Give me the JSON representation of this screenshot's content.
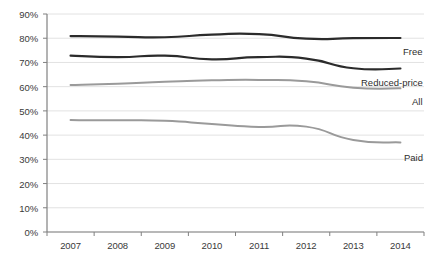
{
  "chart_data": {
    "type": "line",
    "title": "",
    "subtitle": "",
    "xlabel": "",
    "ylabel": "",
    "categories": [
      "2007",
      "2008",
      "2009",
      "2010",
      "2011",
      "2012",
      "2013",
      "2014"
    ],
    "ylim": [
      0,
      90
    ],
    "ytick_labels": [
      "0%",
      "10%",
      "20%",
      "30%",
      "40%",
      "50%",
      "60%",
      "70%",
      "80%",
      "90%"
    ],
    "ytick_values": [
      0,
      10,
      20,
      30,
      40,
      50,
      60,
      70,
      80,
      90
    ],
    "grid": "horizontal",
    "legend_position": "inline-right-of-line-ends",
    "series": [
      {
        "name": "Free",
        "label": "Free",
        "color": "#2b2b2b",
        "width": 2.2,
        "values": [
          80.9,
          80.7,
          80.4,
          81.5,
          81.7,
          79.8,
          80.0,
          80.1
        ]
      },
      {
        "name": "Reduced-price",
        "label": "Reduced-price",
        "color": "#2b2b2b",
        "width": 2.2,
        "values": [
          72.8,
          72.2,
          72.8,
          71.3,
          72.2,
          71.6,
          67.6,
          67.5
        ]
      },
      {
        "name": "All",
        "label": "All",
        "color": "#9a9a9a",
        "width": 2.0,
        "values": [
          60.7,
          61.2,
          62.0,
          62.6,
          62.8,
          62.2,
          59.6,
          59.3
        ]
      },
      {
        "name": "Paid",
        "label": "Paid",
        "color": "#9a9a9a",
        "width": 2.0,
        "values": [
          46.2,
          46.1,
          45.9,
          44.6,
          43.4,
          43.5,
          38.0,
          37.0
        ]
      }
    ]
  },
  "axis_style": {
    "axis_color": "#808080",
    "grid_color": "#e2e2e2"
  }
}
